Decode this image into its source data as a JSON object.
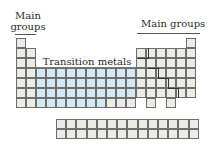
{
  "labels": {
    "left_main_line1": "Main",
    "left_main_line2": "groups",
    "right_main": "Main groups",
    "transition": "Transition metals"
  },
  "colors": {
    "main_group_fill": "#ecece6",
    "transition_fill": "#d6e8f4",
    "grid_line": "#6e6e6e"
  },
  "layout": {
    "cell_size": 10,
    "origin_x": 16,
    "origin_y": 38,
    "main_cells": [
      [
        1,
        1
      ],
      [
        1,
        2
      ],
      [
        2,
        2
      ],
      [
        1,
        3
      ],
      [
        2,
        3
      ],
      [
        1,
        4
      ],
      [
        2,
        4
      ],
      [
        1,
        5
      ],
      [
        2,
        5
      ],
      [
        1,
        6
      ],
      [
        2,
        6
      ],
      [
        1,
        7
      ],
      [
        2,
        7
      ],
      [
        18,
        1
      ],
      [
        13,
        2
      ],
      [
        14,
        2
      ],
      [
        15,
        2
      ],
      [
        16,
        2
      ],
      [
        17,
        2
      ],
      [
        18,
        2
      ],
      [
        13,
        3
      ],
      [
        14,
        3
      ],
      [
        15,
        3
      ],
      [
        16,
        3
      ],
      [
        17,
        3
      ],
      [
        18,
        3
      ],
      [
        13,
        4
      ],
      [
        14,
        4
      ],
      [
        15,
        4
      ],
      [
        16,
        4
      ],
      [
        17,
        4
      ],
      [
        18,
        4
      ],
      [
        13,
        5
      ],
      [
        14,
        5
      ],
      [
        15,
        5
      ],
      [
        16,
        5
      ],
      [
        17,
        5
      ],
      [
        18,
        5
      ],
      [
        13,
        6
      ],
      [
        14,
        6
      ],
      [
        15,
        6
      ],
      [
        16,
        6
      ],
      [
        17,
        6
      ],
      [
        18,
        6
      ],
      [
        14,
        7
      ],
      [
        16,
        7
      ],
      [
        10,
        7
      ],
      [
        11,
        7
      ],
      [
        12,
        7
      ]
    ],
    "transition_cells_rows": [
      4,
      5,
      6,
      7
    ],
    "transition_cols": [
      3,
      4,
      5,
      6,
      7,
      8,
      9,
      10,
      11,
      12
    ],
    "transition_row7_cols": [
      3,
      4,
      5,
      6,
      7,
      8,
      9
    ],
    "fblock": {
      "x": 56,
      "y": 119,
      "cols": 14,
      "rows": 2
    }
  }
}
